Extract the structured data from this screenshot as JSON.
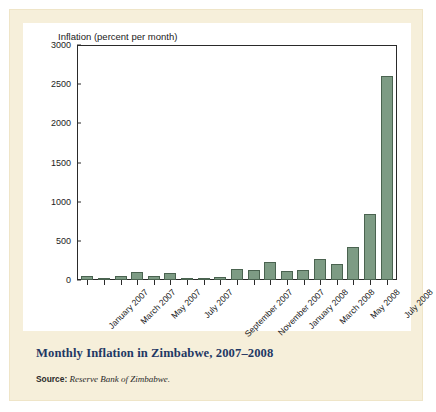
{
  "figure": {
    "caption": "Monthly Inflation in Zimbabwe, 2007–2008",
    "source_label": "Source:",
    "source_text": "Reserve Bank of Zimbabwe.",
    "frame_color": "#f6efda",
    "plot_background": "#ffffff",
    "caption_color": "#1f3864"
  },
  "chart_data": {
    "type": "bar",
    "title": "Monthly Inflation in Zimbabwe, 2007–2008",
    "axis_title": "Inflation (percent per month)",
    "xlabel": "",
    "ylabel": "Inflation (percent per month)",
    "ylim": [
      0,
      3000
    ],
    "yticks": [
      0,
      500,
      1000,
      1500,
      2000,
      2500,
      3000
    ],
    "ytick_labels": [
      "0",
      "500",
      "1000",
      "1500",
      "2000",
      "2500",
      "3000"
    ],
    "grid": false,
    "legend": false,
    "bar_color": "#7d9b84",
    "bar_edge_color": "#4a6350",
    "categories": [
      "January 2007",
      "February 2007",
      "March 2007",
      "April 2007",
      "May 2007",
      "June 2007",
      "July 2007",
      "August 2007",
      "September 2007",
      "October 2007",
      "November 2007",
      "December 2007",
      "January 2008",
      "February 2008",
      "March 2008",
      "April 2008",
      "May 2008",
      "June 2008",
      "July 2008"
    ],
    "values": [
      50,
      30,
      50,
      100,
      50,
      85,
      30,
      12,
      38,
      135,
      130,
      230,
      120,
      130,
      270,
      210,
      425,
      840,
      2600
    ],
    "xtick_labels": [
      "January 2007",
      "March 2007",
      "May 2007",
      "July 2007",
      "September 2007",
      "November 2007",
      "January 2008",
      "March 2008",
      "May 2008",
      "July 2008"
    ],
    "xtick_indices": [
      0,
      2,
      4,
      6,
      8,
      10,
      12,
      14,
      16,
      18
    ]
  }
}
